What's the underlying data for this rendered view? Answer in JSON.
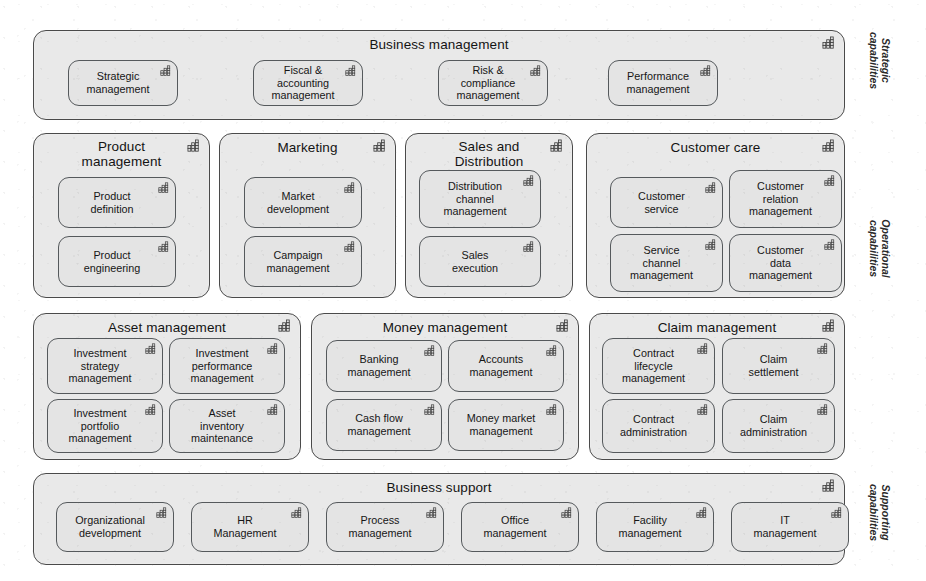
{
  "diagram": {
    "icon_name": "capability-icon",
    "colors": {
      "page_background": "#ffffff",
      "band_fill": "#e9e9e9",
      "capability_fill": "#e4e4e4",
      "band_border": "#4a4a4a",
      "capability_border": "#55595c",
      "text": "#161616"
    }
  },
  "layer_labels": [
    {
      "id": "strategic",
      "text": "Strategic\ncapabilities"
    },
    {
      "id": "operational",
      "text": "Operational\ncapabilities"
    },
    {
      "id": "supporting",
      "text": "Supporting\ncapabilities"
    }
  ],
  "rows": [
    {
      "id": "strategic",
      "layer": "Strategic capabilities",
      "bands": [
        {
          "id": "business-management",
          "title": "Business management",
          "capabilities": [
            {
              "id": "strategic-management",
              "label": "Strategic\nmanagement"
            },
            {
              "id": "fiscal-accounting-management",
              "label": "Fiscal &\naccounting\nmanagement"
            },
            {
              "id": "risk-compliance-management",
              "label": "Risk &\ncompliance\nmanagement"
            },
            {
              "id": "performance-management",
              "label": "Performance\nmanagement"
            }
          ]
        }
      ]
    },
    {
      "id": "operational-top",
      "layer": "Operational capabilities",
      "bands": [
        {
          "id": "product-management",
          "title": "Product\nmanagement",
          "capabilities": [
            {
              "id": "product-definition",
              "label": "Product\ndefinition"
            },
            {
              "id": "product-engineering",
              "label": "Product\nengineering"
            }
          ]
        },
        {
          "id": "marketing",
          "title": "Marketing",
          "capabilities": [
            {
              "id": "market-development",
              "label": "Market\ndevelopment"
            },
            {
              "id": "campaign-management",
              "label": "Campaign\nmanagement"
            }
          ]
        },
        {
          "id": "sales-and-distribution",
          "title": "Sales and\nDistribution",
          "capabilities": [
            {
              "id": "distribution-channel-management",
              "label": "Distribution\nchannel\nmanagement"
            },
            {
              "id": "sales-execution",
              "label": "Sales\nexecution"
            }
          ]
        },
        {
          "id": "customer-care",
          "title": "Customer care",
          "capabilities": [
            {
              "id": "customer-service",
              "label": "Customer\nservice"
            },
            {
              "id": "customer-relation-management",
              "label": "Customer\nrelation\nmanagement"
            },
            {
              "id": "service-channel-management",
              "label": "Service\nchannel\nmanagement"
            },
            {
              "id": "customer-data-management",
              "label": "Customer\ndata\nmanagement"
            }
          ]
        }
      ]
    },
    {
      "id": "operational-bottom",
      "layer": "Operational capabilities",
      "bands": [
        {
          "id": "asset-management",
          "title": "Asset management",
          "capabilities": [
            {
              "id": "investment-strategy-management",
              "label": "Investment\nstrategy\nmanagement"
            },
            {
              "id": "investment-performance-management",
              "label": "Investment\nperformance\nmanagement"
            },
            {
              "id": "investment-portfolio-management",
              "label": "Investment\nportfolio\nmanagement"
            },
            {
              "id": "asset-inventory-maintenance",
              "label": "Asset\ninventory\nmaintenance"
            }
          ]
        },
        {
          "id": "money-management",
          "title": "Money management",
          "capabilities": [
            {
              "id": "banking-management",
              "label": "Banking\nmanagement"
            },
            {
              "id": "accounts-management",
              "label": "Accounts\nmanagement"
            },
            {
              "id": "cash-flow-management",
              "label": "Cash flow\nmanagement"
            },
            {
              "id": "money-market-management",
              "label": "Money market\nmanagement"
            }
          ]
        },
        {
          "id": "claim-management",
          "title": "Claim management",
          "capabilities": [
            {
              "id": "contract-lifecycle-management",
              "label": "Contract\nlifecycle\nmanagement"
            },
            {
              "id": "claim-settlement",
              "label": "Claim\nsettlement"
            },
            {
              "id": "contract-administration",
              "label": "Contract\nadministration"
            },
            {
              "id": "claim-administration",
              "label": "Claim\nadministration"
            }
          ]
        }
      ]
    },
    {
      "id": "supporting",
      "layer": "Supporting capabilities",
      "bands": [
        {
          "id": "business-support",
          "title": "Business support",
          "capabilities": [
            {
              "id": "organizational-development",
              "label": "Organizational\ndevelopment"
            },
            {
              "id": "hr-management",
              "label": "HR\nManagement"
            },
            {
              "id": "process-management",
              "label": "Process\nmanagement"
            },
            {
              "id": "office-management",
              "label": "Office\nmanagement"
            },
            {
              "id": "facility-management",
              "label": "Facility\nmanagement"
            },
            {
              "id": "it-management",
              "label": "IT\nmanagement"
            }
          ]
        }
      ]
    }
  ]
}
